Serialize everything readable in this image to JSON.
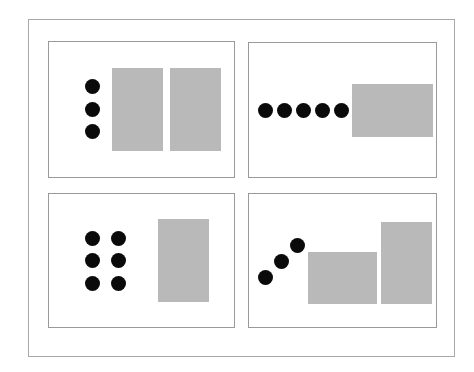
{
  "colors": {
    "dot": "#0a0a0a",
    "rect": "#b9b9b9",
    "border": "#9a9a9a",
    "background": "#ffffff"
  },
  "panels": [
    {
      "id": "panel-1",
      "box": [
        48,
        41,
        187,
        137
      ],
      "dots": [
        [
          92,
          86
        ],
        [
          92,
          109
        ],
        [
          92,
          131
        ]
      ],
      "rects": [
        [
          112,
          68,
          51,
          83
        ],
        [
          170,
          68,
          51,
          83
        ]
      ]
    },
    {
      "id": "panel-2",
      "box": [
        248,
        42,
        189,
        136
      ],
      "dots": [
        [
          265,
          110
        ],
        [
          284,
          110
        ],
        [
          303,
          110
        ],
        [
          322,
          110
        ],
        [
          341,
          110
        ]
      ],
      "rects": [
        [
          352,
          84,
          81,
          53
        ]
      ]
    },
    {
      "id": "panel-3",
      "box": [
        48,
        193,
        187,
        135
      ],
      "dots": [
        [
          92,
          238
        ],
        [
          118,
          238
        ],
        [
          92,
          260
        ],
        [
          118,
          260
        ],
        [
          92,
          283
        ],
        [
          118,
          283
        ]
      ],
      "rects": [
        [
          158,
          219,
          51,
          83
        ]
      ]
    },
    {
      "id": "panel-4",
      "box": [
        248,
        193,
        189,
        135
      ],
      "dots": [
        [
          265,
          277
        ],
        [
          281,
          261
        ],
        [
          297,
          245
        ]
      ],
      "rects": [
        [
          308,
          252,
          69,
          52
        ],
        [
          381,
          222,
          51,
          82
        ]
      ]
    }
  ]
}
